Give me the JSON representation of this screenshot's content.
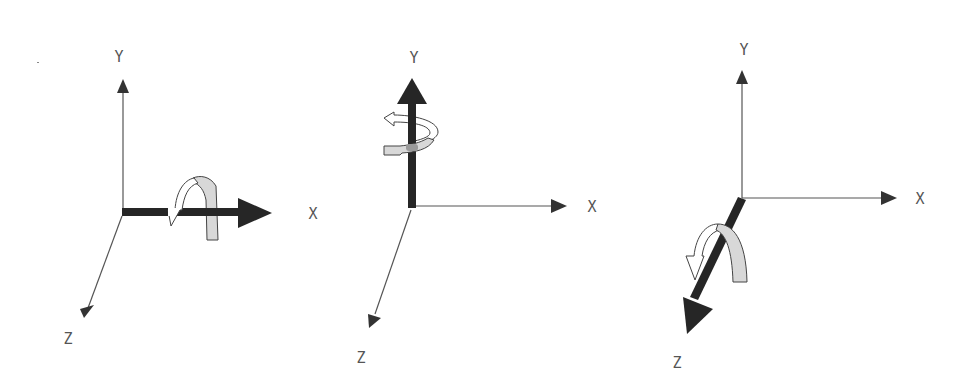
{
  "colors": {
    "thin_axis": "#555555",
    "bold_axis": "#262626",
    "arrow_front": "#ffffff",
    "arrow_back": "#d8d8d8",
    "outline": "#444444",
    "label": "#555555"
  },
  "panels": [
    {
      "id": "rotation-about-x",
      "highlighted_axis": "X",
      "labels": {
        "x": "X",
        "y": "Y",
        "z": "Z"
      }
    },
    {
      "id": "rotation-about-y",
      "highlighted_axis": "Y",
      "labels": {
        "x": "X",
        "y": "Y",
        "z": "Z"
      }
    },
    {
      "id": "rotation-about-z",
      "highlighted_axis": "Z",
      "labels": {
        "x": "X",
        "y": "Y",
        "z": "Z"
      }
    }
  ]
}
